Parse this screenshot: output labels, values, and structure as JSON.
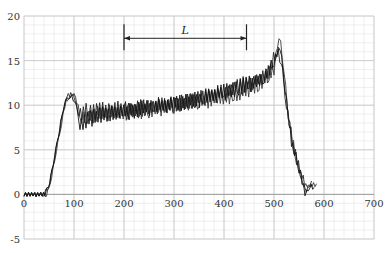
{
  "chart_data": {
    "type": "line",
    "title": "",
    "xlabel": "",
    "ylabel": "",
    "xlim": [
      0,
      700
    ],
    "ylim": [
      -5,
      20
    ],
    "x_ticks": [
      "0",
      "100",
      "200",
      "300",
      "400",
      "500",
      "600",
      "700"
    ],
    "y_ticks": [
      "20",
      "15",
      "10",
      "5",
      "0",
      "-5"
    ],
    "grid": true,
    "minor_grid": true,
    "legend": null,
    "annotation": {
      "label": "L",
      "x_start": 200,
      "x_end": 445,
      "y": 17.5,
      "type": "double-arrow"
    },
    "series": [
      {
        "name": "trace-1",
        "points": [
          [
            0,
            0
          ],
          [
            40,
            0
          ],
          [
            50,
            1
          ],
          [
            60,
            4
          ],
          [
            70,
            7
          ],
          [
            80,
            10
          ],
          [
            90,
            11
          ],
          [
            100,
            11.5
          ],
          [
            110,
            9
          ],
          [
            130,
            9.5
          ],
          [
            200,
            9.5
          ],
          [
            300,
            10
          ],
          [
            400,
            11.5
          ],
          [
            450,
            12.5
          ],
          [
            490,
            13.5
          ],
          [
            505,
            16
          ],
          [
            515,
            15
          ],
          [
            525,
            10
          ],
          [
            540,
            5
          ],
          [
            555,
            2
          ],
          [
            565,
            0.5
          ],
          [
            575,
            1.5
          ]
        ]
      },
      {
        "name": "trace-2",
        "points": [
          [
            0,
            0
          ],
          [
            45,
            0
          ],
          [
            55,
            2
          ],
          [
            65,
            5
          ],
          [
            75,
            8
          ],
          [
            85,
            11
          ],
          [
            95,
            11.3
          ],
          [
            105,
            10.5
          ],
          [
            115,
            8.5
          ],
          [
            150,
            9
          ],
          [
            250,
            9.5
          ],
          [
            350,
            10.5
          ],
          [
            420,
            11
          ],
          [
            470,
            12.5
          ],
          [
            500,
            14
          ],
          [
            510,
            18
          ],
          [
            520,
            14
          ],
          [
            530,
            8
          ],
          [
            545,
            4
          ],
          [
            560,
            1
          ],
          [
            570,
            1
          ],
          [
            585,
            1.2
          ]
        ]
      },
      {
        "name": "trace-3",
        "points": [
          [
            0,
            0
          ],
          [
            42,
            0
          ],
          [
            52,
            1.5
          ],
          [
            62,
            4.5
          ],
          [
            72,
            7.5
          ],
          [
            82,
            10.5
          ],
          [
            92,
            11
          ],
          [
            102,
            10.5
          ],
          [
            112,
            8
          ],
          [
            160,
            9
          ],
          [
            260,
            9.8
          ],
          [
            360,
            10.8
          ],
          [
            430,
            12
          ],
          [
            480,
            13
          ],
          [
            500,
            15
          ],
          [
            512,
            16.5
          ],
          [
            522,
            12
          ],
          [
            535,
            6
          ],
          [
            550,
            3
          ],
          [
            562,
            0
          ],
          [
            572,
            1
          ],
          [
            580,
            0.8
          ]
        ]
      }
    ]
  }
}
